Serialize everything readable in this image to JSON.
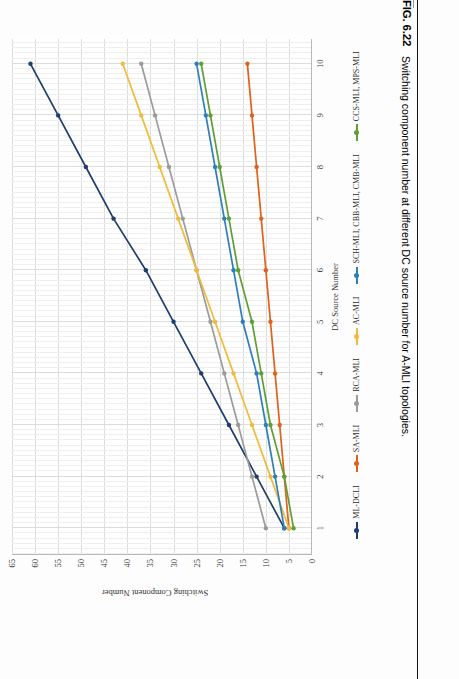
{
  "figure": {
    "number_label": "FIG. 6.22",
    "caption": "Switching component number at different DC source number for A-MLI topologies."
  },
  "chart_data": {
    "type": "line",
    "title": "",
    "xlabel": "DC Source Number",
    "ylabel": "Switching Component Number",
    "x": [
      1,
      2,
      3,
      4,
      5,
      6,
      7,
      8,
      9,
      10
    ],
    "xlim": [
      0.5,
      10.5
    ],
    "ylim": [
      0,
      65
    ],
    "ytick_labels": [
      "0",
      "5",
      "10",
      "15",
      "20",
      "25",
      "30",
      "35",
      "40",
      "45",
      "50",
      "55",
      "60",
      "65"
    ],
    "ytick_values": [
      0,
      5,
      10,
      15,
      20,
      25,
      30,
      35,
      40,
      45,
      50,
      55,
      60,
      65
    ],
    "xtick_labels": [
      "1",
      "2",
      "3",
      "4",
      "5",
      "6",
      "7",
      "8",
      "9",
      "10"
    ],
    "grid": true,
    "legend_position": "bottom",
    "series": [
      {
        "name": "ML-DCLI",
        "color": "#1f3d6e",
        "values": [
          6,
          12,
          18,
          24,
          30,
          36,
          43,
          49,
          55,
          61
        ]
      },
      {
        "name": "SA-MLI",
        "color": "#e1611a",
        "values": [
          5,
          6,
          7,
          8,
          9,
          10,
          11,
          12,
          13,
          14
        ]
      },
      {
        "name": "RCA-MLI",
        "color": "#9b9b9b",
        "values": [
          10,
          13,
          16,
          19,
          22,
          25,
          28,
          31,
          34,
          37
        ]
      },
      {
        "name": "AC-MLI",
        "color": "#f0bb3a",
        "values": [
          5,
          9,
          13,
          17,
          21,
          25,
          29,
          33,
          37,
          41
        ]
      },
      {
        "name": "SCH-MLI, CBB-MLI, CMB-MLI",
        "color": "#2e7ebb",
        "values": [
          6,
          8,
          10,
          12,
          15,
          17,
          19,
          21,
          23,
          25
        ]
      },
      {
        "name": "CCS-MLI, MPS-MLI",
        "color": "#5f9e36",
        "values": [
          4,
          6,
          9,
          11,
          13,
          16,
          18,
          20,
          22,
          24
        ]
      }
    ]
  }
}
